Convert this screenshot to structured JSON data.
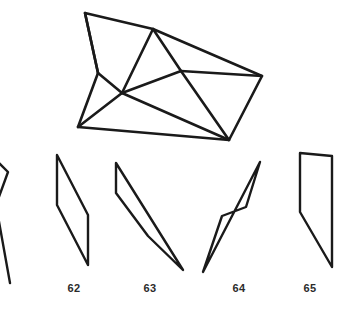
{
  "plate": {
    "width": 344,
    "height": 318,
    "background_color": "#ffffff",
    "stroke_color": "#1a1a1a",
    "caption_color": "#2b2b2b",
    "description": "Technical line drawing: one faceted polyhedron wireframe above a row of five elongated quadrilateral outlines, four of which are numbered"
  },
  "figures": {
    "polyhedron": {
      "name": "faceted-wireframe-polygon",
      "label": "",
      "vertices": {
        "top_left": [
          85,
          13
        ],
        "apex": [
          153,
          29
        ],
        "left_notch": [
          98,
          73
        ],
        "hub": [
          122,
          93
        ],
        "mid_right": [
          181,
          71
        ],
        "right": [
          262,
          76
        ],
        "bottom_left": [
          78,
          127
        ],
        "bottom_right": [
          229,
          140
        ]
      },
      "edges": [
        [
          "top_left",
          "apex"
        ],
        [
          "top_left",
          "left_notch"
        ],
        [
          "left_notch",
          "hub"
        ],
        [
          "left_notch",
          "bottom_left"
        ],
        [
          "bottom_left",
          "hub"
        ],
        [
          "apex",
          "hub"
        ],
        [
          "apex",
          "mid_right"
        ],
        [
          "apex",
          "right"
        ],
        [
          "mid_right",
          "right"
        ],
        [
          "mid_right",
          "hub"
        ],
        [
          "right",
          "bottom_right"
        ],
        [
          "bottom_right",
          "mid_right"
        ],
        [
          "bottom_right",
          "hub"
        ]
      ]
    },
    "quads": [
      {
        "name": "quad-partial-left",
        "label": "",
        "clipped": true,
        "points": "-6,158 8,172 -4,205 10,283"
      },
      {
        "name": "quad-62",
        "label": "62",
        "clipped": false,
        "points": "57,155 88,215 88,265 57,205",
        "label_x": 74,
        "label_y": 288
      },
      {
        "name": "quad-63",
        "label": "63",
        "clipped": false,
        "points": "116,163 183,270 148,236 116,193",
        "label_x": 150,
        "label_y": 288
      },
      {
        "name": "quad-64",
        "label": "64",
        "clipped": false,
        "points": "260,162 203,272 222,216 246,207",
        "label_x": 239,
        "label_y": 288
      },
      {
        "name": "quad-65",
        "label": "65",
        "clipped": false,
        "points": "300,153 332,156 332,267 300,212",
        "label_x": 310,
        "label_y": 288
      }
    ]
  },
  "captions": {
    "items": [
      {
        "text": "62"
      },
      {
        "text": "63"
      },
      {
        "text": "64"
      },
      {
        "text": "65"
      }
    ]
  }
}
